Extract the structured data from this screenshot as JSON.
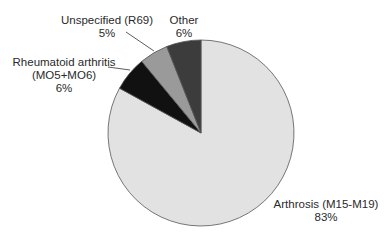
{
  "chart_data": {
    "type": "pie",
    "title": "",
    "start_angle_deg": 0,
    "direction": "clockwise",
    "slices": [
      {
        "label": "Arthrosis (M15-M19)",
        "pct_label": "83%",
        "value": 83,
        "color": "#e2e2e2"
      },
      {
        "label": "Rheumatoid arthritis (MO5+MO6)",
        "pct_label": "6%",
        "value": 6,
        "color": "#111111"
      },
      {
        "label": "Unspecified (R69)",
        "pct_label": "5%",
        "value": 5,
        "color": "#9a9a9a"
      },
      {
        "label": "Other",
        "pct_label": "6%",
        "value": 6,
        "color": "#3c3c3c"
      }
    ],
    "legend": "none (direct labels)"
  },
  "labels": {
    "arthrosis": {
      "line1": "Arthrosis (M15-M19)",
      "line2": "83%"
    },
    "rheumatoid": {
      "line1": "Rheumatoid arthritis",
      "line2": "(MO5+MO6)",
      "line3": "6%"
    },
    "unspecified": {
      "line1": "Unspecified (R69)",
      "line2": "5%"
    },
    "other": {
      "line1": "Other",
      "line2": "6%"
    }
  }
}
